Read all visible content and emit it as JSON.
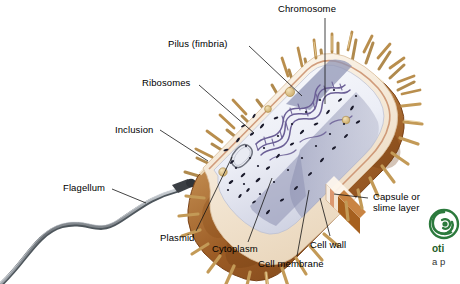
{
  "diagram": {
    "title": "",
    "labels": [
      {
        "id": "chromosome",
        "text": "Chromosome",
        "x": 278,
        "y": 4,
        "align": "left",
        "leader": [
          [
            325,
            18
          ],
          [
            325,
            104
          ]
        ]
      },
      {
        "id": "pilus",
        "text": "Pilus (fimbria)",
        "x": 168,
        "y": 38,
        "align": "left",
        "leader": [
          [
            249,
            46
          ],
          [
            302,
            96
          ]
        ]
      },
      {
        "id": "ribosomes",
        "text": "Ribosomes",
        "x": 142,
        "y": 77,
        "align": "left",
        "leader": [
          [
            199,
            85
          ],
          [
            254,
            133
          ]
        ]
      },
      {
        "id": "inclusion",
        "text": "Inclusion",
        "x": 115,
        "y": 124,
        "align": "left",
        "leader": [
          [
            160,
            130
          ],
          [
            208,
            161
          ]
        ]
      },
      {
        "id": "flagellum",
        "text": "Flagellum",
        "x": 63,
        "y": 183,
        "align": "left",
        "leader": [
          [
            112,
            189
          ],
          [
            146,
            203
          ]
        ]
      },
      {
        "id": "plasmid",
        "text": "Plasmid",
        "x": 160,
        "y": 232,
        "align": "left",
        "leader": [
          [
            196,
            231
          ],
          [
            230,
            156
          ]
        ]
      },
      {
        "id": "cytoplasm",
        "text": "Cytoplasm",
        "x": 212,
        "y": 244,
        "align": "left",
        "leader": [
          [
            248,
            242
          ],
          [
            272,
            176
          ]
        ]
      },
      {
        "id": "cell-membrane",
        "text": "Cell membrane",
        "x": 258,
        "y": 259,
        "align": "left",
        "leader": [
          [
            297,
            256
          ],
          [
            308,
            190
          ]
        ]
      },
      {
        "id": "cell-wall",
        "text": "Cell wall",
        "x": 310,
        "y": 240,
        "align": "left",
        "leader": [
          [
            330,
            236
          ],
          [
            318,
            196
          ]
        ]
      },
      {
        "id": "capsule",
        "text": "Capsule or\nslime layer",
        "x": 373,
        "y": 192,
        "align": "left",
        "leader": [
          [
            368,
            198
          ],
          [
            332,
            194
          ]
        ]
      }
    ]
  },
  "logo": {
    "mark": "spiral-leaf-logo",
    "line1": "oti",
    "line2": "a p",
    "color": "#1d5c28"
  },
  "palette": {
    "capsule_outer": "#9a5a25",
    "capsule_mid": "#c08a4e",
    "capsule_light": "#e8d5b8",
    "pili": "#c79a58",
    "cell_wall_cream": "#f5ece0",
    "cytoplasm": "#eef0f6",
    "cytoplasm_shadow": "#9fa2c0",
    "chromosome": "#6b5f96",
    "ribosome_dot": "#1a1a2a",
    "flagellum": "#8d9298",
    "leader_line": "#1a1a1a"
  }
}
